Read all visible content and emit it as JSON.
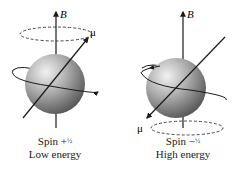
{
  "figure": {
    "panels": [
      {
        "id": "spin-plus-half",
        "field_label": "B",
        "moment_label": "μ",
        "spin_label": "Spin +",
        "spin_value": "½",
        "energy_label": "Low energy",
        "moment_direction": "aligned with B"
      },
      {
        "id": "spin-minus-half",
        "field_label": "B",
        "moment_label": "μ",
        "spin_label": "Spin −",
        "spin_value": "½",
        "energy_label": "High energy",
        "moment_direction": "opposed to B"
      }
    ],
    "colors": {
      "line": "#1a1a1a",
      "sphere_light": "#e8e8e8",
      "sphere_dark": "#5a5a5a"
    }
  }
}
